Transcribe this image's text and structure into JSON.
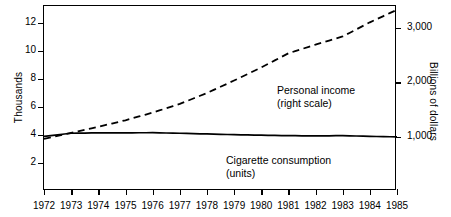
{
  "axes": {
    "left_title": "Thousands",
    "right_title": "Billions of dollars",
    "left_ticks": [
      "12",
      "10",
      "8",
      "6",
      "4",
      "2"
    ],
    "right_ticks": [
      "3,000",
      "2,000",
      "1,000"
    ],
    "x_ticks": [
      "1972",
      "1973",
      "1974",
      "1975",
      "1976",
      "1977",
      "1978",
      "1979",
      "1980",
      "1981",
      "1982",
      "1983",
      "1984",
      "1985"
    ]
  },
  "annotations": {
    "income_line1": "Personal income",
    "income_line2": "(right scale)",
    "cigarette_line1": "Cigarette consumption",
    "cigarette_line2": "(units)"
  },
  "colors": {
    "ink": "#000000",
    "background": "#ffffff"
  },
  "chart_data": {
    "type": "line",
    "title": "",
    "xlabel": "",
    "ylabel": "Thousands",
    "ylabel_right": "Billions of dollars",
    "grid": false,
    "legend": "inline-annotations",
    "x": [
      1972,
      1973,
      1974,
      1975,
      1976,
      1977,
      1978,
      1979,
      1980,
      1981,
      1982,
      1983,
      1984,
      1985
    ],
    "xlim": [
      1972,
      1985
    ],
    "ylim_left": [
      0,
      13.2
    ],
    "ylim_right": [
      0,
      3400
    ],
    "left_tick_values": [
      12,
      10,
      8,
      6,
      4,
      2
    ],
    "right_tick_values": [
      3000,
      2000,
      1000
    ],
    "series": [
      {
        "name": "Personal income (right scale)",
        "style": "dashed",
        "scale": "right",
        "unit": "Billions of dollars",
        "values": [
          960,
          1070,
          1180,
          1300,
          1440,
          1600,
          1800,
          2030,
          2270,
          2530,
          2690,
          2840,
          3100,
          3330
        ]
      },
      {
        "name": "Cigarette consumption (units)",
        "style": "solid",
        "scale": "left",
        "unit": "Thousands",
        "values": [
          3.9,
          4.12,
          4.15,
          4.15,
          4.16,
          4.12,
          4.07,
          4.02,
          3.98,
          3.95,
          3.93,
          3.95,
          3.9,
          3.86
        ]
      }
    ]
  }
}
